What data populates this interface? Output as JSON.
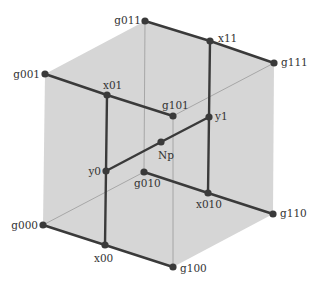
{
  "diagram": {
    "type": "cube-graph",
    "colors": {
      "face": "#d6d6d6",
      "thick_edge": "#3a3a3a",
      "thin_edge": "#9a9a9a",
      "node": "#3a3a3a",
      "label": "#333333"
    },
    "nodes": [
      {
        "id": "g011",
        "label": "g011",
        "x": 145,
        "y": 21,
        "lx": 141,
        "ly": 24,
        "anchor": "end"
      },
      {
        "id": "g001",
        "label": "g001",
        "x": 45,
        "y": 74,
        "lx": 40,
        "ly": 78,
        "anchor": "end"
      },
      {
        "id": "x01",
        "label": "x01",
        "x": 107,
        "y": 95,
        "lx": 103,
        "ly": 89,
        "anchor": "start"
      },
      {
        "id": "x11",
        "label": "x11",
        "x": 210,
        "y": 41,
        "lx": 218,
        "ly": 42,
        "anchor": "start"
      },
      {
        "id": "g111",
        "label": "g111",
        "x": 274,
        "y": 63,
        "lx": 281,
        "ly": 66,
        "anchor": "start"
      },
      {
        "id": "g101",
        "label": "g101",
        "x": 173,
        "y": 116,
        "lx": 162,
        "ly": 109,
        "anchor": "start"
      },
      {
        "id": "y1",
        "label": "y1",
        "x": 209,
        "y": 117,
        "lx": 215,
        "ly": 120,
        "anchor": "start"
      },
      {
        "id": "Np",
        "label": "Np",
        "x": 161,
        "y": 142,
        "lx": 158,
        "ly": 159,
        "anchor": "start"
      },
      {
        "id": "y0",
        "label": "y0",
        "x": 106,
        "y": 171,
        "lx": 101,
        "ly": 175,
        "anchor": "end"
      },
      {
        "id": "g010",
        "label": "g010",
        "x": 144,
        "y": 172,
        "lx": 134,
        "ly": 187,
        "anchor": "start"
      },
      {
        "id": "x010",
        "label": "x010",
        "x": 208,
        "y": 193,
        "lx": 196,
        "ly": 208,
        "anchor": "start"
      },
      {
        "id": "g110",
        "label": "g110",
        "x": 273,
        "y": 214,
        "lx": 280,
        "ly": 217,
        "anchor": "start"
      },
      {
        "id": "g000",
        "label": "g000",
        "x": 43,
        "y": 225,
        "lx": 38,
        "ly": 229,
        "anchor": "end"
      },
      {
        "id": "x00",
        "label": "x00",
        "x": 105,
        "y": 245,
        "lx": 94,
        "ly": 262,
        "anchor": "start"
      },
      {
        "id": "g100",
        "label": "g100",
        "x": 173,
        "y": 267,
        "lx": 180,
        "ly": 272,
        "anchor": "start"
      }
    ],
    "thick_edges": [
      [
        "g011",
        "x11"
      ],
      [
        "x11",
        "g111"
      ],
      [
        "g001",
        "x01"
      ],
      [
        "x01",
        "g101"
      ],
      [
        "x01",
        "y0"
      ],
      [
        "y0",
        "x00"
      ],
      [
        "x11",
        "y1"
      ],
      [
        "y1",
        "x010"
      ],
      [
        "y0",
        "Np"
      ],
      [
        "Np",
        "y1"
      ],
      [
        "g010",
        "x010"
      ],
      [
        "x010",
        "g110"
      ],
      [
        "g000",
        "x00"
      ],
      [
        "x00",
        "g100"
      ]
    ],
    "thin_edges": [
      [
        "g011",
        "g010"
      ],
      [
        "g010",
        "g000"
      ],
      [
        "g101",
        "g111"
      ],
      [
        "g101",
        "g100"
      ]
    ],
    "outline": [
      "g011",
      "g111",
      "g110",
      "g100",
      "g000",
      "g001"
    ]
  }
}
